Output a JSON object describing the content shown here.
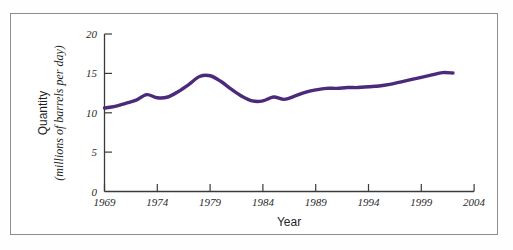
{
  "figure": {
    "background_color": "#ffffff",
    "frame_color": "#8d8d8d",
    "line_color": "#4b2a7b"
  },
  "chart_data": {
    "type": "line",
    "title": "",
    "subtitle": "",
    "xlabel": "Year",
    "ylabel": "Quantity",
    "ylabel_line1": "Quantity",
    "ylabel_line2": "(millions of barrels per day)",
    "xlim": [
      1969,
      2004
    ],
    "ylim": [
      0,
      20
    ],
    "xticks": [
      1969,
      1974,
      1979,
      1984,
      1989,
      1994,
      1999,
      2004
    ],
    "xtick_labels": [
      "1969",
      "1974",
      "1979",
      "1984",
      "1989",
      "1994",
      "1999",
      "2004"
    ],
    "yticks": [
      0,
      5,
      10,
      15,
      20
    ],
    "ytick_labels": [
      "0",
      "5",
      "10",
      "15",
      "20"
    ],
    "grid": false,
    "legend": "none",
    "series": [
      {
        "name": "Quantity of oil (millions of barrels per day)",
        "color": "#4b2a7b",
        "x": [
          1969,
          1970,
          1971,
          1972,
          1973,
          1974,
          1975,
          1976,
          1977,
          1978,
          1979,
          1980,
          1981,
          1982,
          1983,
          1984,
          1985,
          1986,
          1987,
          1988,
          1989,
          1990,
          1991,
          1992,
          1993,
          1994,
          1995,
          1996,
          1997,
          1998,
          1999,
          2000,
          2001,
          2002
        ],
        "y": [
          10.6,
          10.8,
          11.2,
          11.6,
          12.3,
          11.9,
          12.0,
          12.7,
          13.6,
          14.6,
          14.7,
          14.0,
          13.0,
          12.1,
          11.5,
          11.5,
          12.0,
          11.7,
          12.1,
          12.6,
          12.9,
          13.1,
          13.1,
          13.2,
          13.2,
          13.3,
          13.4,
          13.6,
          13.9,
          14.2,
          14.5,
          14.8,
          15.1,
          15.05
        ]
      }
    ]
  },
  "axes": {
    "x_axis_name": "year-axis",
    "y_axis_name": "quantity-axis"
  }
}
